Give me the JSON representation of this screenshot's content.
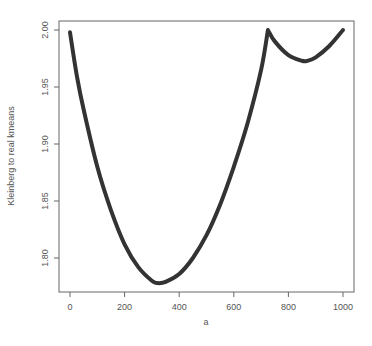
{
  "chart_data": {
    "type": "line",
    "title": "",
    "xlabel": "a",
    "ylabel": "Kleinberg to real kmeans",
    "xlim": [
      0,
      1000
    ],
    "ylim": [
      1.775,
      2.0
    ],
    "grid": false,
    "legend": null,
    "x_ticks": [
      0,
      200,
      400,
      600,
      800,
      1000
    ],
    "x_tick_labels": [
      "0",
      "200",
      "400",
      "600",
      "800",
      "1000"
    ],
    "y_ticks": [
      1.8,
      1.85,
      1.9,
      1.95,
      2.0
    ],
    "y_tick_labels": [
      "1.80",
      "1.85",
      "1.90",
      "1.95",
      "2.00"
    ],
    "series": [
      {
        "name": "Kleinberg to real kmeans",
        "color": "#333333",
        "x": [
          0,
          25,
          50,
          100,
          150,
          200,
          250,
          300,
          320,
          350,
          400,
          450,
          500,
          550,
          600,
          650,
          700,
          725,
          750,
          800,
          850,
          870,
          900,
          950,
          1000
        ],
        "y": [
          1.998,
          1.96,
          1.93,
          1.88,
          1.842,
          1.812,
          1.792,
          1.78,
          1.778,
          1.779,
          1.786,
          1.8,
          1.82,
          1.847,
          1.88,
          1.918,
          1.965,
          2.0,
          1.99,
          1.978,
          1.973,
          1.973,
          1.976,
          1.986,
          2.0
        ]
      }
    ]
  }
}
